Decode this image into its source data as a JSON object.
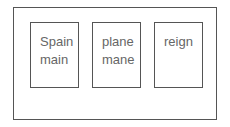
{
  "cards": [
    {
      "lines": [
        "Spain",
        "main"
      ]
    },
    {
      "lines": [
        "plane",
        "mane"
      ]
    },
    {
      "lines": [
        "reign"
      ]
    }
  ]
}
